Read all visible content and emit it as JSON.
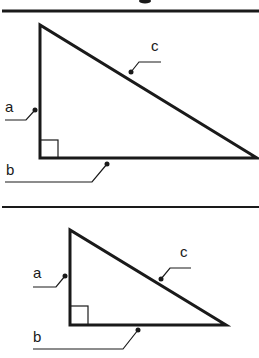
{
  "figure": {
    "colors": {
      "background": "#ffffff",
      "stroke": "#1a1a1a"
    }
  },
  "dividers": [
    {
      "y": 11,
      "thickness": 3
    },
    {
      "y": 207,
      "thickness": 2
    }
  ],
  "triangles": [
    {
      "name": "large",
      "vertices": {
        "top": [
          40,
          25
        ],
        "right_angle": [
          40,
          158
        ],
        "right": [
          257,
          158
        ]
      },
      "right_angle_box": 18,
      "labels": {
        "a": {
          "text": "a",
          "x": 5,
          "y": 99
        },
        "b": {
          "text": "b",
          "x": 6,
          "y": 162
        },
        "c": {
          "text": "c",
          "x": 151,
          "y": 38
        }
      }
    },
    {
      "name": "small",
      "vertices": {
        "top": [
          70,
          230
        ],
        "right_angle": [
          70,
          325
        ],
        "right": [
          226,
          325
        ]
      },
      "right_angle_box": 18,
      "labels": {
        "a": {
          "text": "a",
          "x": 33,
          "y": 265
        },
        "b": {
          "text": "b",
          "x": 33,
          "y": 329
        },
        "c": {
          "text": "c",
          "x": 180,
          "y": 244
        }
      }
    }
  ]
}
